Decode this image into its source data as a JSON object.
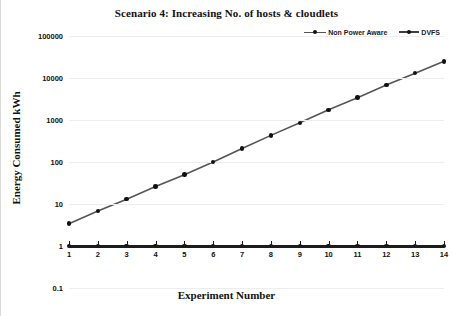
{
  "title": "Scenario 4: Increasing No. of hosts & cloudlets",
  "axes": {
    "x_title": "Experiment Number",
    "y_title": "Energy Consumed kWh"
  },
  "legend": {
    "position": "top-right",
    "entries": [
      {
        "label": "Non Power Aware",
        "marker": "line-dot-marker",
        "color": "#555555"
      },
      {
        "label": "DVFS",
        "marker": "line-dot-marker",
        "color": "#3d3d3d"
      }
    ]
  },
  "chart_data": {
    "type": "line",
    "title": "Scenario 4: Increasing No. of hosts & cloudlets",
    "xlabel": "Experiment Number",
    "ylabel": "Energy Consumed kWh",
    "yscale": "log",
    "ylim": [
      0.1,
      100000
    ],
    "ytick_labels": [
      "100000",
      "10000",
      "1000",
      "100",
      "10",
      "1",
      "0.1"
    ],
    "ytick_values": [
      100000,
      10000,
      1000,
      100,
      10,
      1,
      0.1
    ],
    "xlim": [
      1,
      14
    ],
    "grid": true,
    "categories": [
      1,
      2,
      3,
      4,
      5,
      6,
      7,
      8,
      9,
      10,
      11,
      12,
      13,
      14
    ],
    "xtick_labels": [
      "1",
      "2",
      "3",
      "4",
      "5",
      "6",
      "7",
      "8",
      "9",
      "10",
      "11",
      "12",
      "13",
      "14"
    ],
    "series": [
      {
        "name": "Non Power Aware",
        "color": "#555555",
        "marker_color": "#111111",
        "values": [
          3.4,
          6.8,
          13,
          26,
          50,
          100,
          210,
          430,
          860,
          1750,
          3400,
          6800,
          13000,
          25000
        ]
      },
      {
        "name": "DVFS",
        "color": "#1c1c1c",
        "marker_color": "#111111",
        "values": [
          1,
          1,
          1,
          1,
          1,
          1,
          1,
          1,
          1,
          1,
          1,
          1,
          1,
          1
        ]
      }
    ]
  }
}
